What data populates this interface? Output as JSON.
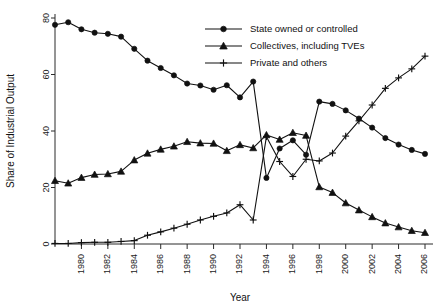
{
  "chart_data": {
    "type": "line",
    "title": "",
    "xlabel": "Year",
    "ylabel": "Share of Industrial Output",
    "xlim": [
      1978,
      2006
    ],
    "ylim": [
      0,
      80
    ],
    "grid": false,
    "legend_position": "top-right",
    "x": [
      1978,
      1979,
      1980,
      1981,
      1982,
      1983,
      1984,
      1985,
      1986,
      1987,
      1988,
      1989,
      1990,
      1991,
      1992,
      1993,
      1994,
      1995,
      1996,
      1997,
      1998,
      1999,
      2000,
      2001,
      2002,
      2003,
      2004,
      2005,
      2006
    ],
    "xticks": [
      1980,
      1982,
      1984,
      1986,
      1988,
      1990,
      1992,
      1994,
      1996,
      1998,
      2000,
      2002,
      2004,
      2006
    ],
    "xticklabels": [
      "1980",
      "1982",
      "1984",
      "1986",
      "1988",
      "1990",
      "1992",
      "1994",
      "1996",
      "1998",
      "2000",
      "2002",
      "2004",
      "2006"
    ],
    "yticks": [
      0,
      20,
      40,
      60,
      80
    ],
    "yticklabels": [
      "0",
      "20",
      "40",
      "60",
      "80"
    ],
    "series": [
      {
        "name": "State owned or controlled",
        "marker": "circle",
        "values": [
          77.6,
          78.5,
          76.0,
          74.8,
          74.4,
          73.4,
          69.1,
          64.9,
          62.3,
          59.7,
          56.8,
          56.1,
          54.6,
          56.2,
          51.9,
          57.5,
          23.4,
          33.8,
          36.7,
          31.6,
          50.4,
          49.6,
          47.3,
          44.4,
          41.2,
          37.5,
          35.2,
          33.3,
          31.9
        ]
      },
      {
        "name": "Collectives, including TVEs",
        "marker": "triangle",
        "values": [
          22.4,
          21.5,
          23.5,
          24.6,
          24.8,
          25.7,
          29.7,
          32.1,
          33.5,
          34.6,
          36.2,
          35.7,
          35.6,
          33.0,
          35.1,
          34.0,
          38.6,
          37.0,
          39.4,
          38.4,
          20.2,
          18.2,
          14.5,
          12.0,
          9.6,
          7.4,
          6.0,
          4.7,
          4.0
        ]
      },
      {
        "name": "Private and others",
        "marker": "plus",
        "values": [
          0.2,
          0.2,
          0.5,
          0.6,
          0.6,
          0.9,
          1.2,
          3.1,
          4.3,
          5.6,
          7.0,
          8.5,
          9.8,
          11.0,
          13.9,
          8.5,
          38.0,
          29.2,
          23.9,
          30.0,
          29.4,
          32.2,
          38.2,
          43.6,
          49.2,
          55.1,
          58.8,
          62.0,
          66.5
        ]
      }
    ],
    "legend": [
      {
        "label": "State owned or controlled",
        "marker": "circle"
      },
      {
        "label": "Collectives, including TVEs",
        "marker": "triangle"
      },
      {
        "label": "Private and others",
        "marker": "plus"
      }
    ],
    "colors": {
      "line": "#111111",
      "axis": "#2b2b2b",
      "background": "#ffffff"
    }
  }
}
